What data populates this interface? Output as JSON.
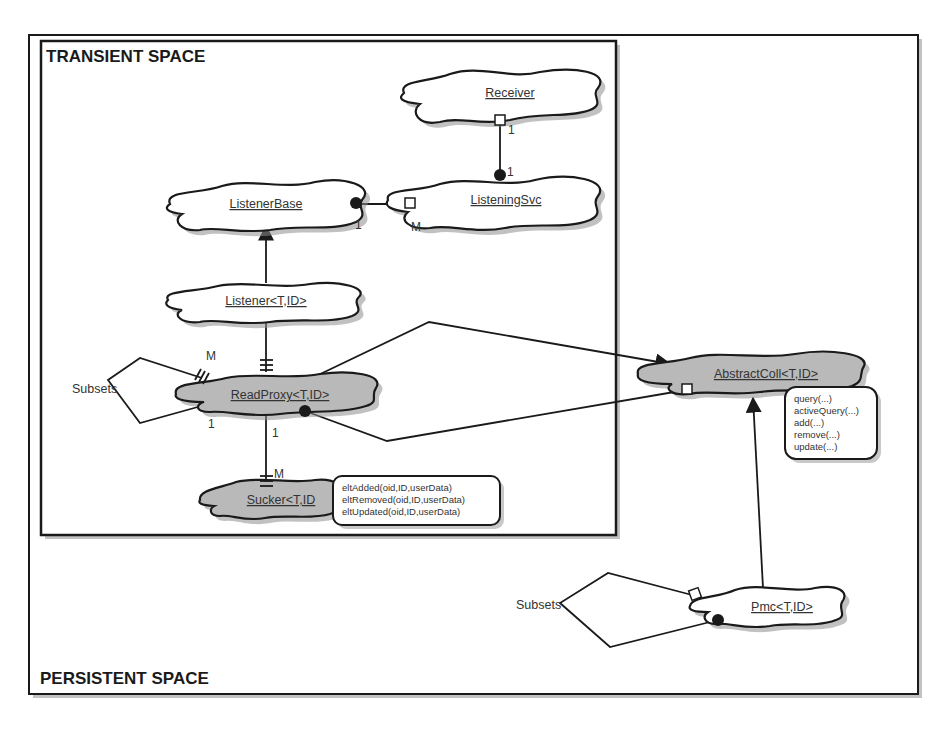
{
  "frames": {
    "persistent": {
      "label": "PERSISTENT SPACE"
    },
    "transient": {
      "label": "TRANSIENT SPACE"
    }
  },
  "classes": {
    "receiver": {
      "label": "Receiver",
      "fill": "#ffffff"
    },
    "listener_base": {
      "label": "ListenerBase",
      "fill": "#ffffff"
    },
    "listening_svc": {
      "label": "ListeningSvc",
      "fill": "#ffffff"
    },
    "listener": {
      "label": "Listener<T,ID>",
      "fill": "#ffffff"
    },
    "read_proxy": {
      "label": "ReadProxy<T,ID>",
      "fill": "#b9b9b9"
    },
    "sucker": {
      "label": "Sucker<T,ID",
      "fill": "#b9b9b9"
    },
    "abstract_coll": {
      "label": "AbstractColl<T,ID>",
      "fill": "#b9b9b9"
    },
    "pmc": {
      "label": "Pmc<T,ID>",
      "fill": "#ffffff"
    }
  },
  "notes": {
    "sucker_methods": [
      "eltAdded(oid,ID,userData)",
      "eltRemoved(oid,ID,userData)",
      "eltUpdated(oid,ID,userData)"
    ],
    "abstract_coll_methods": [
      "query(...)",
      "activeQuery(...)",
      "add(...)",
      "remove(...)",
      "update(...)"
    ]
  },
  "relations": {
    "receiver_listeningsvc": {
      "from_mult": "1",
      "to_mult": "1"
    },
    "listenerbase_listeningsvc": {
      "from_mult": "1",
      "to_mult": "M"
    },
    "readproxy_subsets": {
      "label": "Subsets",
      "mult_top": "M",
      "mult_bottom": "1"
    },
    "readproxy_sucker": {
      "from_mult": "1",
      "to_mult": "M"
    },
    "pmc_subsets": {
      "label": "Subsets"
    }
  }
}
